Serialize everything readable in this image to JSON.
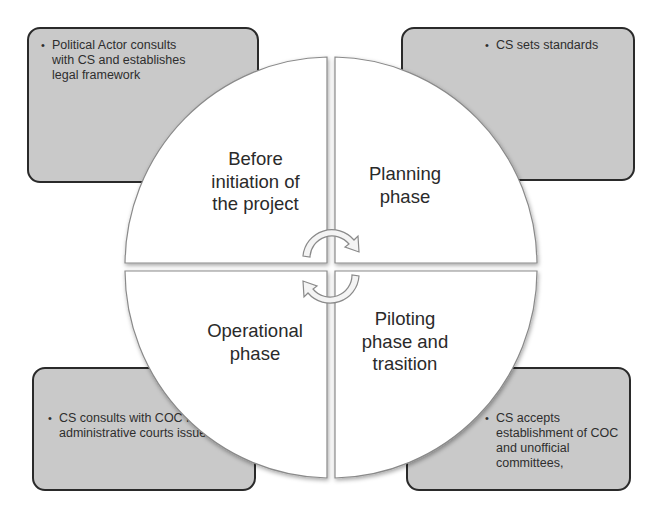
{
  "diagram": {
    "type": "cycle",
    "quadrants": [
      {
        "position": "top-left",
        "label_lines": [
          "Before",
          "initiation of",
          "the project"
        ]
      },
      {
        "position": "top-right",
        "label_lines": [
          "Planning",
          "phase"
        ]
      },
      {
        "position": "bottom-left",
        "label_lines": [
          "Operational",
          "phase"
        ]
      },
      {
        "position": "bottom-right",
        "label_lines": [
          "Piloting",
          "phase and",
          "trasition"
        ]
      }
    ],
    "center_icon": "circular-arrows-icon",
    "callouts": {
      "top_left": {
        "bullet": "Political Actor consults with CS and establishes legal framework"
      },
      "top_right": {
        "bullet": "CS sets standards"
      },
      "bottom_left": {
        "bullet": "CS consults with COC for administrative courts issues"
      },
      "bottom_right": {
        "bullet": "CS accepts establishment of COC and unofficial committees,"
      }
    },
    "colors": {
      "callout_fill": "#c9c9c9",
      "callout_border": "#2a2a2a",
      "wheel_fill": "#ffffff",
      "wheel_stroke": "#8a8a8a"
    }
  }
}
